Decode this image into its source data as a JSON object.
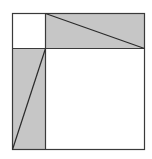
{
  "diagram": {
    "type": "geometric-square-dissection",
    "outer_square": {
      "x1": 12.5,
      "y1": 13.5,
      "x2": 144.5,
      "y2": 149.5
    },
    "divider_x": 45.5,
    "divider_y": 48.5,
    "colors": {
      "fill_shaded": "#c6c6c6",
      "fill_white": "#ffffff",
      "stroke": "#3a3a3a"
    },
    "regions": [
      {
        "name": "small-square-top-left",
        "shaded": false
      },
      {
        "name": "top-rectangle",
        "shaded": true
      },
      {
        "name": "left-rectangle",
        "shaded": true
      },
      {
        "name": "large-square-bottom-right",
        "shaded": false
      }
    ],
    "diagonals": [
      {
        "name": "top-rectangle-diagonal",
        "from": [
          45.5,
          13.5
        ],
        "to": [
          144.5,
          48.5
        ]
      },
      {
        "name": "left-rectangle-diagonal",
        "from": [
          12.5,
          149.5
        ],
        "to": [
          45.5,
          48.5
        ]
      }
    ]
  }
}
